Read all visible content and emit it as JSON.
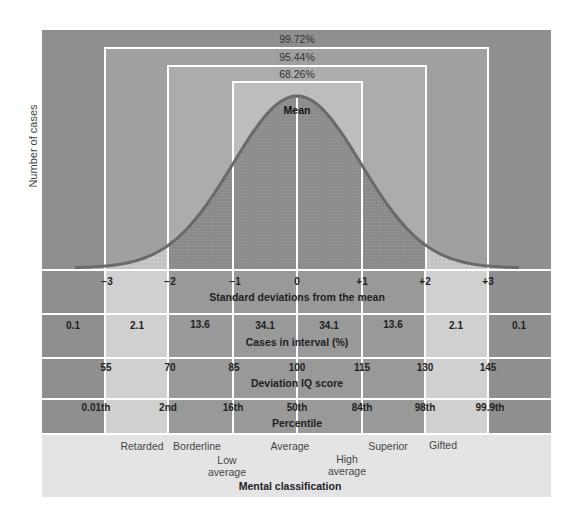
{
  "chart_data": {
    "type": "area",
    "title": "",
    "ylabel": "Number of cases",
    "xlabel": "Standard deviations from the mean",
    "curve": "normal distribution (bell curve)",
    "mean_label": "Mean",
    "x_ticks": [
      "−3",
      "−2",
      "−1",
      "0",
      "+1",
      "+2",
      "+3"
    ],
    "x_values": [
      -3,
      -2,
      -1,
      0,
      1,
      2,
      3
    ],
    "coverage_bands": [
      {
        "range": [
          -3,
          3
        ],
        "label": "99.72%"
      },
      {
        "range": [
          -2,
          2
        ],
        "label": "95.44%"
      },
      {
        "range": [
          -1,
          1
        ],
        "label": "68.26%"
      }
    ],
    "rows": [
      {
        "title": "Cases in interval (%)",
        "intervals": [
          "< −3",
          "−3 to −2",
          "−2 to −1",
          "−1 to 0",
          "0 to +1",
          "+1 to +2",
          "+2 to +3",
          "> +3"
        ],
        "values": [
          0.1,
          2.1,
          13.6,
          34.1,
          34.1,
          13.6,
          2.1,
          0.1
        ]
      },
      {
        "title": "Deviation IQ score",
        "values": [
          55,
          70,
          85,
          100,
          115,
          130,
          145
        ]
      },
      {
        "title": "Percentile",
        "values": [
          "0.01th",
          "2nd",
          "16th",
          "50th",
          "84th",
          "98th",
          "99.9th"
        ]
      }
    ],
    "mental_classification": {
      "title": "Mental classification",
      "categories": [
        "Retarded",
        "Borderline",
        "Low average",
        "Average",
        "High average",
        "Superior",
        "Gifted"
      ]
    }
  },
  "labels": {
    "y_axis": "Number of cases",
    "band_99": "99.72%",
    "band_95": "95.44%",
    "band_68": "68.26%",
    "mean": "Mean",
    "sd_title": "Standard deviations from the mean",
    "sd": [
      "−3",
      "−2",
      "−1",
      "0",
      "+1",
      "+2",
      "+3"
    ],
    "cases_title": "Cases in interval (%)",
    "cases": [
      "0.1",
      "2.1",
      "13.6",
      "34.1",
      "34.1",
      "13.6",
      "2.1",
      "0.1"
    ],
    "iq_title": "Deviation IQ score",
    "iq": [
      "55",
      "70",
      "85",
      "100",
      "115",
      "130",
      "145"
    ],
    "pct_title": "Percentile",
    "pct": [
      "0.01th",
      "2nd",
      "16th",
      "50th",
      "84th",
      "98th",
      "99.9th"
    ],
    "class_title": "Mental classification",
    "classes": {
      "retarded": "Retarded",
      "borderline": "Borderline",
      "low_avg_1": "Low",
      "low_avg_2": "average",
      "average": "Average",
      "high_avg_1": "High",
      "high_avg_2": "average",
      "superior": "Superior",
      "gifted": "Gifted"
    }
  },
  "colors": {
    "outer": "#8f8f8f",
    "band95": "#a3a3a3",
    "band68": "#b4b4b4",
    "center": "#c4c4c4",
    "curve_fill": "#8a8a8a",
    "curve_line": "#6e6e6e",
    "light_cell": "#d2d2d2",
    "class_bg": "#e6e6e6"
  }
}
